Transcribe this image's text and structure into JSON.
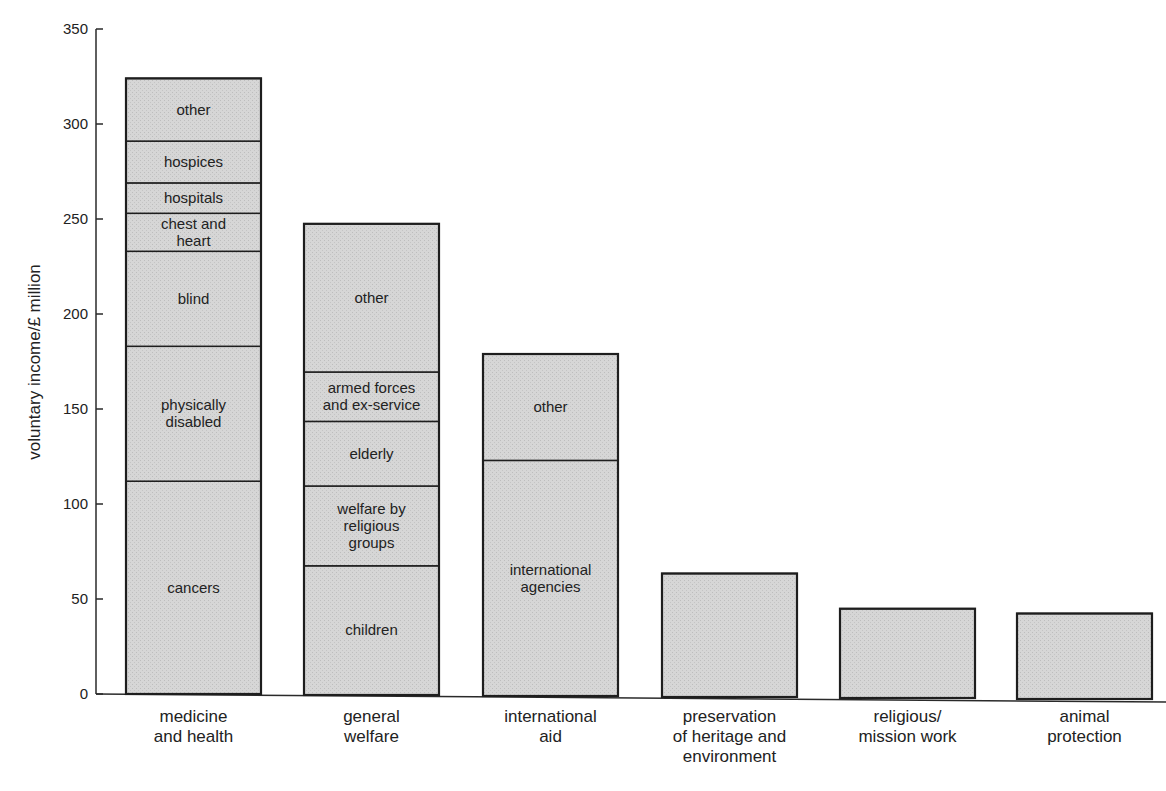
{
  "chart_data": {
    "type": "bar",
    "stacked": true,
    "title": "",
    "xlabel": "",
    "ylabel": "voluntary income/£ million",
    "ylim": [
      0,
      350
    ],
    "yticks": [
      0,
      50,
      100,
      150,
      200,
      250,
      300,
      350
    ],
    "grid": false,
    "legend": "none (segments labelled inside bars)",
    "categories": [
      "medicine and health",
      "general welfare",
      "international aid",
      "preservation of heritage and environment",
      "religious/ mission work",
      "animal protection"
    ],
    "bars": [
      {
        "category": "medicine and health",
        "label_lines": [
          "medicine",
          "and health"
        ],
        "total": 324,
        "segments": [
          {
            "name": "cancers",
            "lines": [
              "cancers"
            ],
            "value": 112
          },
          {
            "name": "physically disabled",
            "lines": [
              "physically",
              "disabled"
            ],
            "value": 71
          },
          {
            "name": "blind",
            "lines": [
              "blind"
            ],
            "value": 50
          },
          {
            "name": "chest and heart",
            "lines": [
              "chest and",
              "heart"
            ],
            "value": 20
          },
          {
            "name": "hospitals",
            "lines": [
              "hospitals"
            ],
            "value": 16
          },
          {
            "name": "hospices",
            "lines": [
              "hospices"
            ],
            "value": 22
          },
          {
            "name": "other",
            "lines": [
              "other"
            ],
            "value": 33
          }
        ]
      },
      {
        "category": "general welfare",
        "label_lines": [
          "general",
          "welfare"
        ],
        "total": 248,
        "segments": [
          {
            "name": "children",
            "lines": [
              "children"
            ],
            "value": 68
          },
          {
            "name": "welfare by religious groups",
            "lines": [
              "welfare by",
              "religious",
              "groups"
            ],
            "value": 42
          },
          {
            "name": "elderly",
            "lines": [
              "elderly"
            ],
            "value": 34
          },
          {
            "name": "armed forces and ex-service",
            "lines": [
              "armed forces",
              "and ex-service"
            ],
            "value": 26
          },
          {
            "name": "other",
            "lines": [
              "other"
            ],
            "value": 78
          }
        ]
      },
      {
        "category": "international aid",
        "label_lines": [
          "international",
          "aid"
        ],
        "total": 180,
        "segments": [
          {
            "name": "international agencies",
            "lines": [
              "international",
              "agencies"
            ],
            "value": 124
          },
          {
            "name": "other",
            "lines": [
              "other"
            ],
            "value": 56
          }
        ]
      },
      {
        "category": "preservation of heritage and environment",
        "label_lines": [
          "preservation",
          "of heritage and",
          "environment"
        ],
        "total": 65,
        "segments": [
          {
            "name": "",
            "lines": [],
            "value": 65
          }
        ]
      },
      {
        "category": "religious/ mission work",
        "label_lines": [
          "religious/",
          "mission work"
        ],
        "total": 47,
        "segments": [
          {
            "name": "",
            "lines": [],
            "value": 47
          }
        ]
      },
      {
        "category": "animal protection",
        "label_lines": [
          "animal",
          "protection"
        ],
        "total": 45,
        "segments": [
          {
            "name": "",
            "lines": [],
            "value": 45
          }
        ]
      }
    ]
  },
  "colors": {
    "bar_fill": "#d3d3d3",
    "bar_stroke": "#1e1e1e",
    "axis": "#2a2a2a",
    "text": "#222222"
  }
}
